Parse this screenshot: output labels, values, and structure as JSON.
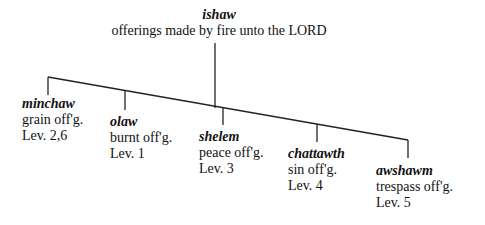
{
  "root": {
    "term": "ishaw",
    "description": "offerings made by fire unto the LORD"
  },
  "children": [
    {
      "term": "minchaw",
      "description": "grain off'g.",
      "reference": "Lev. 2,6"
    },
    {
      "term": "olaw",
      "description": "burnt off'g.",
      "reference": "Lev. 1"
    },
    {
      "term": "shelem",
      "description": "peace off'g.",
      "reference": "Lev. 3"
    },
    {
      "term": "chattawth",
      "description": "sin off'g.",
      "reference": "Lev. 4"
    },
    {
      "term": "awshawm",
      "description": "trespass off'g.",
      "reference": "Lev. 5"
    }
  ],
  "colors": {
    "line": "#222222",
    "text": "#111111",
    "background": "#ffffff"
  }
}
